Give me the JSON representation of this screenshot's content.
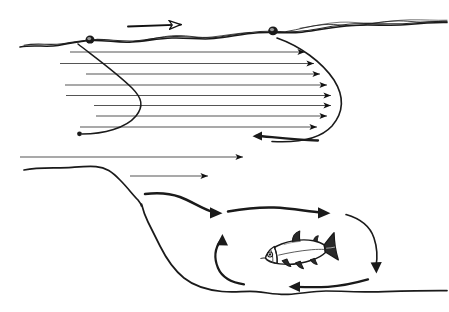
{
  "figure": {
    "title": "River cross-section flow diagram",
    "subject": "stream velocity profile, surface drift, pool eddy and holding fish",
    "background_color": "#ffffff",
    "ink_color": "#1a1a1a",
    "streamline_color": "#555555",
    "width": 449,
    "height": 312
  },
  "scene": {
    "wind_arrow": {
      "name": "surface wind arrow",
      "style": "open outline arrowhead",
      "direction": "right",
      "x1": 128,
      "y1": 26,
      "x2": 186,
      "y2": 24
    },
    "water_surface": {
      "name": "water surface line",
      "style": "wavy double sketched line",
      "description": "irregular hand drawn surface running left to right and rising slightly to the right"
    },
    "floaters": [
      {
        "name": "floating-object-left",
        "cx": 90,
        "cy": 40,
        "r": 4.2
      },
      {
        "name": "floating-object-right",
        "cx": 273,
        "cy": 31,
        "r": 4.6
      }
    ],
    "velocity_profile": {
      "name": "parabolic velocity profile",
      "description": "horizontal streamlines whose arrow tips trace a parabola, longest at mid depth",
      "arrow_count": 8,
      "envelope": "parabola opening left, apex at right",
      "streamlines": [
        {
          "y": 52,
          "x_start": 70,
          "x_tip": 308
        },
        {
          "y": 64,
          "x_start": 60,
          "x_tip": 317
        },
        {
          "y": 74,
          "x_start": 86,
          "x_tip": 323
        },
        {
          "y": 84,
          "x_start": 65,
          "x_tip": 330
        },
        {
          "y": 94,
          "x_start": 66,
          "x_tip": 334
        },
        {
          "y": 104,
          "x_start": 94,
          "x_tip": 334
        },
        {
          "y": 115,
          "x_start": 96,
          "x_tip": 330
        },
        {
          "y": 126,
          "x_start": 78,
          "x_tip": 320
        }
      ],
      "reverse_hook": {
        "name": "near-bed reverse flow hook",
        "description": "line curving back to the left at the base of the profile",
        "tip_x": 258,
        "tip_y": 136
      }
    },
    "lower_streamlines": [
      {
        "name": "sub-profile-streamline-1",
        "y": 157,
        "x_start": 20,
        "x_tip": 247
      },
      {
        "name": "sub-profile-streamline-2",
        "y": 176,
        "x_start": 130,
        "x_tip": 212
      }
    ],
    "riverbed": {
      "name": "riverbed and pool outline",
      "description": "bed runs flat from the left, drops steeply into a deep pool, then flattens to the right edge",
      "drop_x": 110,
      "pool_bottom_y": 292
    },
    "pool_eddy": {
      "name": "recirculating eddy",
      "rotation": "clockwise",
      "arrows": [
        {
          "name": "eddy-inflow-arrow",
          "direction": "right",
          "tip_x": 222,
          "tip_y": 214
        },
        {
          "name": "eddy-top-arrow",
          "direction": "right",
          "tip_x": 330,
          "tip_y": 212
        },
        {
          "name": "eddy-descending-arrow",
          "direction": "down",
          "tip_x": 377,
          "tip_y": 270
        },
        {
          "name": "eddy-return-arrow",
          "direction": "left",
          "tip_x": 294,
          "tip_y": 287
        },
        {
          "name": "eddy-rising-arrow",
          "direction": "up",
          "tip_x": 226,
          "tip_y": 239
        }
      ]
    },
    "fish": {
      "name": "holding fish",
      "facing": "left",
      "center_x": 296,
      "center_y": 252,
      "length": 62,
      "features": [
        "head",
        "eye",
        "gill",
        "dorsal fin",
        "adipose fin",
        "pectoral fin",
        "pelvic fin",
        "anal fin",
        "forked caudal fin",
        "lateral line"
      ]
    }
  },
  "labels": []
}
